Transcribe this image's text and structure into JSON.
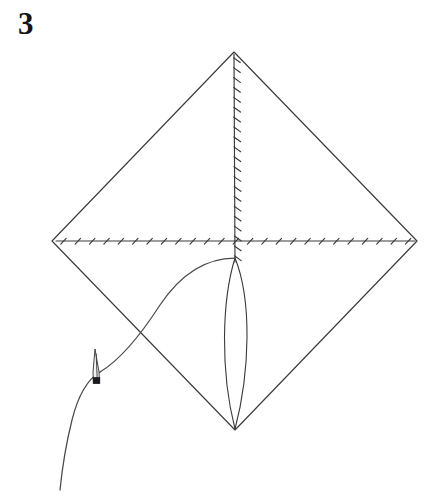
{
  "figure": {
    "step_number": "3",
    "background_color": "#ffffff",
    "line_color": "#3a3a3c",
    "thread_color": "#4a4a4d",
    "needle_color": "#303033",
    "width": 430,
    "height": 499
  },
  "diagram": {
    "type": "needlework-stitch-diagram",
    "shape_name": "diamond-outline",
    "vertices": {
      "top": [
        234,
        52
      ],
      "left": [
        52,
        241
      ],
      "right": [
        417,
        241
      ],
      "bottom": [
        235,
        430
      ]
    },
    "diamond_path": "M 234 52 L 417 241 L 235 430 L 52 241 Z",
    "guide_lines": [
      {
        "name": "vertical-guide-line",
        "from": [
          234,
          54
        ],
        "to": [
          235,
          262
        ],
        "stitch_count": 21,
        "stitch_spacing": 10,
        "stitch_direction": "right-down"
      },
      {
        "name": "horizontal-guide-line",
        "from": [
          56,
          241
        ],
        "to": [
          415,
          241
        ],
        "stitch_count": 25,
        "stitch_spacing": 14.5,
        "stitch_direction": "up-right"
      }
    ],
    "leaf_stitch": {
      "name": "leaf-lens-shape",
      "top_point": [
        235,
        258
      ],
      "bottom_point": [
        235,
        429
      ],
      "left_curve": "M 235 258 C 222 300 220 370 235 429",
      "right_curve": "M 235 258 C 252 300 250 372 235 429"
    },
    "thread": {
      "name": "working-thread",
      "arc_path": "M 235 258 C 205 258 180 275 160 305 C 140 336 120 360 100 372",
      "tail_path": "M 100 372 C 88 379 78 396 72 420 C 66 444 62 470 60 490",
      "crossing_point": [
        150,
        330
      ]
    },
    "needle": {
      "name": "sewing-needle",
      "tip": [
        95,
        349
      ],
      "eye_center": [
        96,
        381
      ],
      "length": 34,
      "orientation": "near-vertical-slight-right"
    }
  }
}
